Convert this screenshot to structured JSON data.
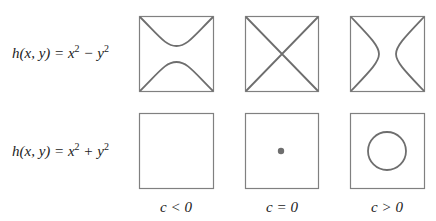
{
  "rows": [
    {
      "function_label": "h(x, y) = x² − y²",
      "lhs": "h(x, y) = x",
      "op": " − y",
      "exp": "2"
    },
    {
      "function_label": "h(x, y) = x² + y²",
      "lhs": "h(x, y) = x",
      "op": " + y",
      "exp": "2"
    }
  ],
  "columns": [
    {
      "label": "c < 0"
    },
    {
      "label": "c = 0"
    },
    {
      "label": "c > 0"
    }
  ],
  "panels": {
    "saddle_c_neg": "hyperbola opening up/down",
    "saddle_c_zero": "crossing lines",
    "saddle_c_pos": "hyperbola opening left/right",
    "bowl_c_neg": "empty",
    "bowl_c_zero": "point",
    "bowl_c_pos": "circle"
  },
  "colors": {
    "stroke": "#7a7a7a",
    "curve": "#6e6e6e"
  }
}
